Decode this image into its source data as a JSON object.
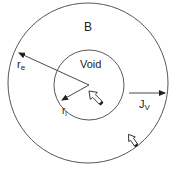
{
  "diagram": {
    "outer_region_label": "B",
    "inner_region_label": "Void",
    "outer_radius_label": {
      "main": "r",
      "sub": "e"
    },
    "inner_radius_label": {
      "main": "r",
      "sub": "i"
    },
    "flux_label": {
      "main": "J",
      "sub": "V"
    },
    "colors": {
      "stroke": "#333333",
      "background": "#ffffff",
      "text": "#222222"
    }
  }
}
